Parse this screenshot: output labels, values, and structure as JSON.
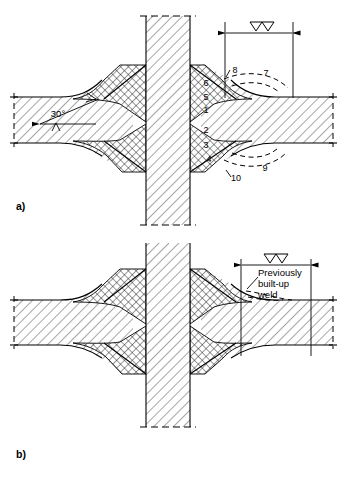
{
  "figure": {
    "background_color": "#ffffff",
    "line_color": "#000000",
    "hatch_color": "#333333"
  },
  "panels": [
    {
      "id": "a",
      "label": "a)",
      "dimension": {
        "surface_finish_symbol": "∇∇",
        "symbol_name": "machining-finish-symbol"
      },
      "angle": {
        "value": "30°",
        "name": "groove-angle"
      },
      "weld_pass_numbers": [
        {
          "id": "6",
          "x": 206,
          "y": 86
        },
        {
          "id": "5",
          "x": 206,
          "y": 100
        },
        {
          "id": "1",
          "x": 206,
          "y": 113
        },
        {
          "id": "2",
          "x": 206,
          "y": 133
        },
        {
          "id": "3",
          "x": 206,
          "y": 148
        },
        {
          "id": "4",
          "x": 209,
          "y": 162
        }
      ],
      "profile_numbers": [
        {
          "id": "8",
          "x": 235,
          "y": 73
        },
        {
          "id": "7",
          "x": 266,
          "y": 76
        },
        {
          "id": "9",
          "x": 265,
          "y": 171
        },
        {
          "id": "10",
          "x": 236,
          "y": 180
        }
      ]
    },
    {
      "id": "b",
      "label": "b)",
      "dimension": {
        "surface_finish_symbol": "∇∇",
        "symbol_name": "machining-finish-symbol"
      },
      "callout": {
        "name": "previously-built-up-weld-callout",
        "lines": [
          "Previously",
          "built-up",
          "weld"
        ]
      }
    }
  ]
}
